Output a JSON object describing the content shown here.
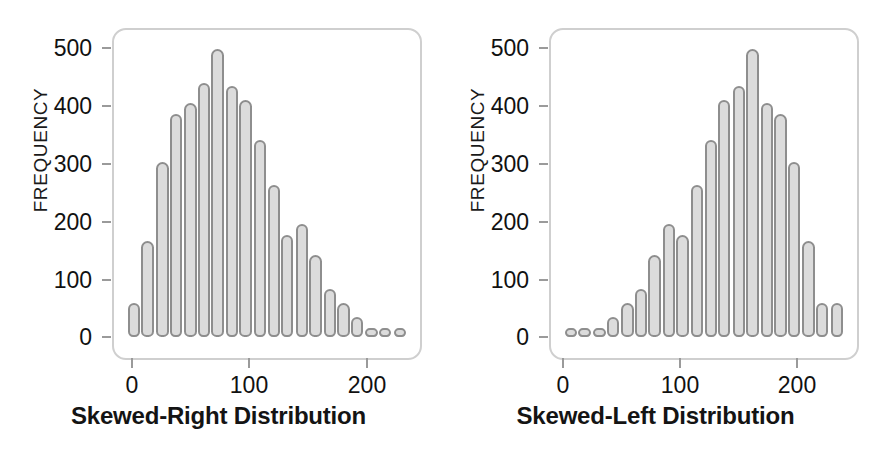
{
  "figure": {
    "background_color": "#ffffff",
    "bar_fill_color": "#dcdcdc",
    "bar_stroke_color": "#8e8e8e",
    "frame_color": "#cfcfcf",
    "text_color": "#141414"
  },
  "chart_data": [
    {
      "type": "bar",
      "title": "Skewed-Right Distribution",
      "xlabel": "",
      "ylabel": "FREQUENCY",
      "xlim": [
        -5,
        232
      ],
      "ylim": [
        0,
        530
      ],
      "xticks": [
        0,
        100,
        200
      ],
      "xtick_labels": [
        "0",
        "100",
        "200"
      ],
      "yticks": [
        0,
        100,
        200,
        300,
        400,
        500
      ],
      "ytick_labels": [
        "0",
        "100",
        "200",
        "300",
        "400",
        "500"
      ],
      "grid": false,
      "legend": "none",
      "bin_width": 11.4,
      "x": [
        5,
        16,
        28,
        39,
        51,
        62,
        73,
        85,
        96,
        108,
        119,
        130,
        142,
        153,
        165,
        176,
        187,
        199,
        210,
        222
      ],
      "values": [
        60,
        170,
        310,
        395,
        415,
        450,
        510,
        445,
        420,
        350,
        270,
        180,
        200,
        145,
        85,
        60,
        35,
        10,
        10,
        10
      ]
    },
    {
      "type": "bar",
      "title": "Skewed-Left Distribution",
      "xlabel": "",
      "ylabel": "FREQUENCY",
      "xlim": [
        -5,
        232
      ],
      "ylim": [
        0,
        530
      ],
      "xticks": [
        0,
        100,
        200
      ],
      "xtick_labels": [
        "0",
        "100",
        "200"
      ],
      "yticks": [
        0,
        100,
        200,
        300,
        400,
        500
      ],
      "ytick_labels": [
        "0",
        "100",
        "200",
        "300",
        "400",
        "500"
      ],
      "grid": false,
      "legend": "none",
      "bin_width": 11.4,
      "x": [
        5,
        16,
        28,
        39,
        51,
        62,
        73,
        85,
        96,
        108,
        119,
        130,
        142,
        153,
        165,
        176,
        187,
        199,
        210,
        222
      ],
      "values": [
        10,
        10,
        10,
        35,
        60,
        85,
        145,
        200,
        180,
        270,
        350,
        420,
        445,
        510,
        415,
        395,
        310,
        170,
        60,
        60
      ]
    }
  ]
}
